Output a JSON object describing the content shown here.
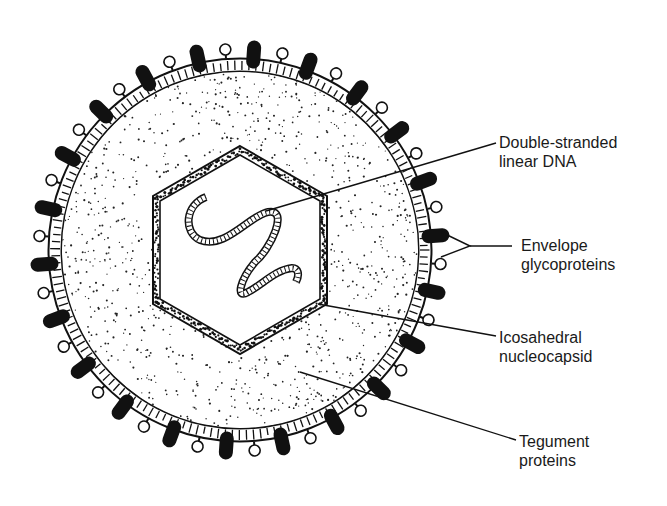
{
  "diagram": {
    "colors": {
      "ink": "#111111",
      "background": "#ffffff"
    },
    "labels": [
      {
        "id": "dna",
        "lines": [
          "Double-stranded",
          "linear DNA"
        ]
      },
      {
        "id": "envelope",
        "lines": [
          "Envelope",
          "glycoproteins"
        ]
      },
      {
        "id": "nucleocapsid",
        "lines": [
          "Icosahedral",
          "nucleocapsid"
        ]
      },
      {
        "id": "tegument",
        "lines": [
          "Tegument",
          "proteins"
        ]
      }
    ]
  }
}
